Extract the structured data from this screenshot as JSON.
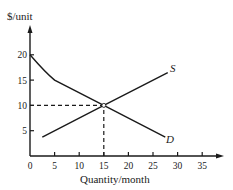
{
  "chart_data": {
    "type": "line",
    "title": "",
    "xlabel": "Quantity/month",
    "ylabel": "$/unit",
    "xlim": [
      0,
      37
    ],
    "ylim": [
      0,
      25
    ],
    "x_ticks": [
      "0",
      "5",
      "10",
      "15",
      "20",
      "25",
      "30",
      "35"
    ],
    "y_ticks": [
      "5",
      "10",
      "15",
      "20"
    ],
    "grid": false,
    "legend": "none",
    "series": [
      {
        "name": "S",
        "label": "S",
        "points": [
          [
            2.5,
            3.75
          ],
          [
            15,
            10
          ],
          [
            28,
            16.5
          ]
        ]
      },
      {
        "name": "D",
        "label": "D",
        "points": [
          [
            0,
            20
          ],
          [
            5,
            15
          ],
          [
            15,
            10
          ],
          [
            27.5,
            3.75
          ]
        ]
      }
    ],
    "annotations": [
      {
        "type": "equilibrium-point",
        "x": 15,
        "y": 10
      },
      {
        "type": "dashed-guide",
        "from": [
          0,
          10
        ],
        "to": [
          15,
          10
        ]
      },
      {
        "type": "dashed-guide",
        "from": [
          15,
          0
        ],
        "to": [
          15,
          10
        ]
      }
    ]
  },
  "labels": {
    "y_axis": "$/unit",
    "x_axis": "Quantity/month",
    "supply": "S",
    "demand": "D"
  },
  "ticks": {
    "x": [
      "0",
      "5",
      "10",
      "15",
      "20",
      "25",
      "30",
      "35"
    ],
    "y": [
      "5",
      "10",
      "15",
      "20"
    ]
  },
  "colors": {
    "ink": "#1a1a1a",
    "background": "#ffffff"
  }
}
